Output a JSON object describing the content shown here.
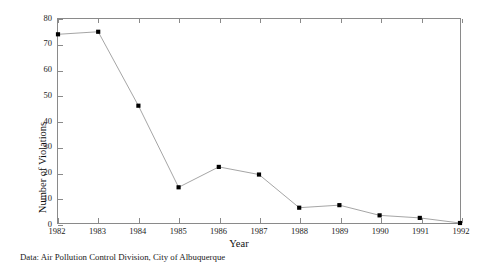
{
  "chart_data": {
    "type": "line",
    "title": "",
    "subtitle": "",
    "xlabel": "Year",
    "ylabel": "Number of Violations",
    "categories": [
      "1982",
      "1983",
      "1984",
      "1985",
      "1986",
      "1987",
      "1988",
      "1989",
      "1990",
      "1991",
      "1992"
    ],
    "x": [
      1982,
      1983,
      1984,
      1985,
      1986,
      1987,
      1988,
      1989,
      1990,
      1991,
      1992
    ],
    "values": [
      74,
      75,
      46,
      14,
      22,
      19,
      6,
      7,
      3,
      2,
      0
    ],
    "series": [
      {
        "name": "Number of Violations",
        "values": [
          74,
          75,
          46,
          14,
          22,
          19,
          6,
          7,
          3,
          2,
          0
        ]
      }
    ],
    "xlim": [
      1982,
      1992
    ],
    "ylim": [
      0,
      80
    ],
    "ytick_labels": [
      "0",
      "10",
      "20",
      "30",
      "40",
      "50",
      "60",
      "70",
      "80"
    ],
    "ytick_values": [
      0,
      10,
      20,
      30,
      40,
      50,
      60,
      70,
      80
    ],
    "xtick_labels": [
      "1982",
      "1983",
      "1984",
      "1985",
      "1986",
      "1987",
      "1988",
      "1989",
      "1990",
      "1991",
      "1992"
    ],
    "grid": false,
    "legend": null,
    "legend_position": "none",
    "marker": "square",
    "marker_color": "#000000",
    "line_color": "#9a9a9a",
    "frame_color": "#8a8a8a",
    "background": "#ffffff"
  },
  "caption": {
    "text": "Data: Air Pollution Control Division, City of Albuquerque"
  }
}
